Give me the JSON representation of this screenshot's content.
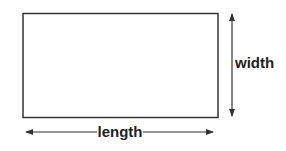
{
  "diagram": {
    "shape": "rectangle",
    "labels": {
      "width": "width",
      "length": "length"
    },
    "colors": {
      "stroke": "#333333",
      "text": "#222222",
      "background": "#ffffff"
    }
  }
}
